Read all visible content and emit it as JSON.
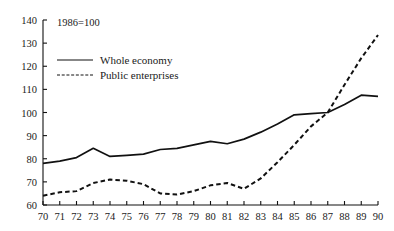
{
  "chart_data": {
    "type": "line",
    "title": "",
    "subtitle": "",
    "annotation": "1986=100",
    "xlabel": "",
    "ylabel": "",
    "xlim": [
      70,
      90
    ],
    "ylim": [
      60,
      140
    ],
    "grid": false,
    "legend_position": "top-left",
    "x": [
      70,
      71,
      72,
      73,
      74,
      75,
      76,
      77,
      78,
      79,
      80,
      81,
      82,
      83,
      84,
      85,
      86,
      87,
      88,
      89,
      90
    ],
    "xtick_labels": [
      "70",
      "71",
      "72",
      "73",
      "74",
      "75",
      "76",
      "77",
      "78",
      "79",
      "80",
      "81",
      "82",
      "83",
      "84",
      "85",
      "86",
      "87",
      "88",
      "89",
      "90"
    ],
    "ytick_labels": [
      "60",
      "70",
      "80",
      "90",
      "100",
      "110",
      "120",
      "130",
      "140"
    ],
    "yticks": [
      60,
      70,
      80,
      90,
      100,
      110,
      120,
      130,
      140
    ],
    "series": [
      {
        "name": "Whole economy",
        "style": "solid",
        "color": "#111111",
        "values": [
          78,
          79,
          80.5,
          84.5,
          81,
          81.5,
          82,
          84,
          84.5,
          86,
          87.5,
          86.5,
          88.5,
          91.5,
          95,
          99,
          99.5,
          100,
          103.5,
          107.5,
          107
        ]
      },
      {
        "name": "Public enterprises",
        "style": "dashed",
        "color": "#111111",
        "values": [
          64,
          65.5,
          66,
          69.5,
          71,
          70.5,
          69,
          65,
          64.5,
          66,
          68.5,
          69.5,
          67,
          71.5,
          78.5,
          86,
          94,
          100,
          112,
          123.5,
          133.5
        ]
      }
    ]
  },
  "legend": {
    "entries": [
      {
        "label": "Whole economy",
        "swatch": "solid-line-swatch"
      },
      {
        "label": "Public enterprises",
        "swatch": "dashed-line-swatch"
      }
    ]
  }
}
